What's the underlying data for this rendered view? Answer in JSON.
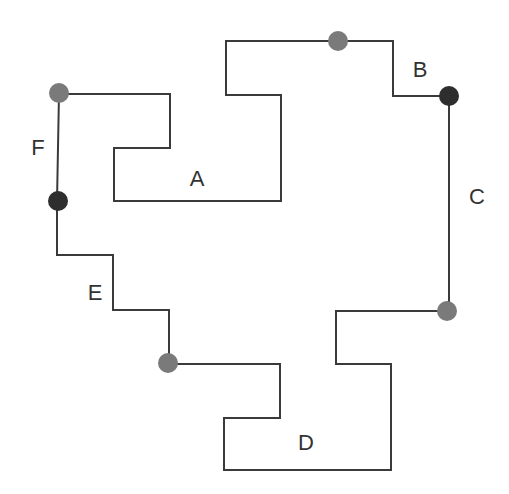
{
  "diagram": {
    "stroke_color": "#3a3a3a",
    "dot_light": "#7a7a7a",
    "dot_dark": "#2e2e2e",
    "path": "M 59 94 L 170 94 L 170 148 L 114 148 L 114 201 L 281 201 L 281 95 L 226 95 L 226 41 L 393 41 L 393 96 L 449 96 L 449 311 L 336 311 L 336 364 L 391 364 L 391 470 L 224 470 L 224 418 L 280 418 L 280 364 L 169 364 L 169 310 L 113 310 L 113 255 L 57 255 L 57 201 L 59 94",
    "dots": [
      {
        "id": "dot-top",
        "x": 338,
        "y": 41,
        "tone": "light"
      },
      {
        "id": "dot-b",
        "x": 449,
        "y": 96,
        "tone": "dark"
      },
      {
        "id": "dot-c",
        "x": 447,
        "y": 311,
        "tone": "light"
      },
      {
        "id": "dot-e",
        "x": 168,
        "y": 363,
        "tone": "light"
      },
      {
        "id": "dot-f-bottom",
        "x": 58,
        "y": 201,
        "tone": "dark"
      },
      {
        "id": "dot-f-top",
        "x": 59,
        "y": 93,
        "tone": "light"
      }
    ],
    "labels": [
      {
        "text": "A",
        "x": 197,
        "y": 186
      },
      {
        "text": "B",
        "x": 420,
        "y": 77
      },
      {
        "text": "C",
        "x": 477,
        "y": 204
      },
      {
        "text": "D",
        "x": 306,
        "y": 450
      },
      {
        "text": "E",
        "x": 95,
        "y": 300
      },
      {
        "text": "F",
        "x": 38,
        "y": 155
      }
    ]
  }
}
